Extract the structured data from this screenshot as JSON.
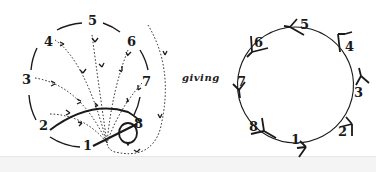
{
  "figure": {
    "connector_text": "giving",
    "left_diagram": {
      "description": "Eight points on a dashed circle with dotted arrow paths converging toward point 1; solid curved stroke from 2 toward 8; loop near 8",
      "labels": [
        "1",
        "2",
        "3",
        "4",
        "5",
        "6",
        "7",
        "8"
      ]
    },
    "right_diagram": {
      "description": "Eight labeled nodes on a circle, each marked with a Y-shaped arrow glyph",
      "labels": [
        "1",
        "2",
        "3",
        "4",
        "5",
        "6",
        "7",
        "8"
      ]
    },
    "colors": {
      "ink": "#1a1a1a",
      "background": "#ffffff"
    }
  }
}
